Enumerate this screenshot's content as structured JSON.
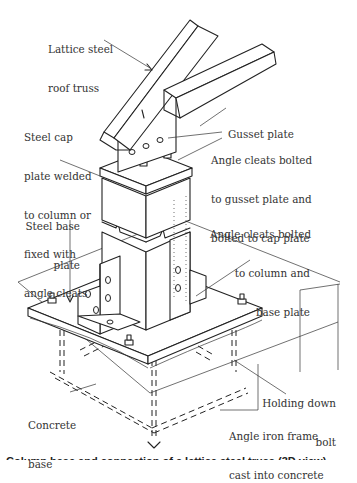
{
  "figure": {
    "labels": {
      "roof_truss": [
        "Lattice steel",
        "roof truss"
      ],
      "gusset_plate": [
        "Gusset plate"
      ],
      "angle_cleats_top": [
        "Angle cleats bolted",
        "to gusset plate and",
        "bolted to cap plate"
      ],
      "cap_plate": [
        "Steel cap",
        "plate welded",
        "to column or",
        "fixed with",
        "angle cleats"
      ],
      "base_plate": [
        "Steel base",
        "plate"
      ],
      "angle_cleats_base": [
        "Angle cleats bolted",
        "to column and",
        "base plate"
      ],
      "holding_down_bolt": [
        "Holding down",
        "bolt"
      ],
      "concrete_base": [
        "Concrete",
        "base"
      ],
      "angle_iron_frame": [
        "Angle iron frame",
        "cast into concrete"
      ]
    },
    "caption": "Column base and connection of a lattice steel truss (3D view)"
  }
}
